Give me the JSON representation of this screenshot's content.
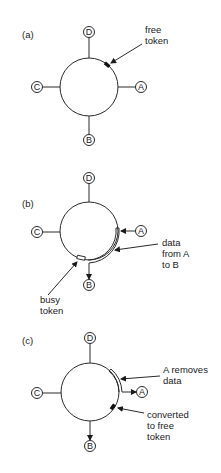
{
  "figure": {
    "panels": [
      {
        "label": "(a)",
        "nodes": {
          "top": "D",
          "right": "A",
          "bottom": "B",
          "left": "C"
        },
        "annotations": [
          {
            "id": "free_token",
            "lines": [
              "free",
              "token"
            ]
          }
        ]
      },
      {
        "label": "(b)",
        "nodes": {
          "top": "D",
          "right": "A",
          "bottom": "B",
          "left": "C"
        },
        "annotations": [
          {
            "id": "data_a_to_b",
            "lines": [
              "data",
              "from A",
              "to B"
            ]
          },
          {
            "id": "busy_token",
            "lines": [
              "busy",
              "token"
            ]
          }
        ]
      },
      {
        "label": "(c)",
        "nodes": {
          "top": "D",
          "right": "A",
          "bottom": "B",
          "left": "C"
        },
        "annotations": [
          {
            "id": "a_removes_data",
            "lines": [
              "A removes",
              "data"
            ]
          },
          {
            "id": "converted_free_token",
            "lines": [
              "converted",
              "to free",
              "token"
            ]
          }
        ]
      }
    ]
  }
}
